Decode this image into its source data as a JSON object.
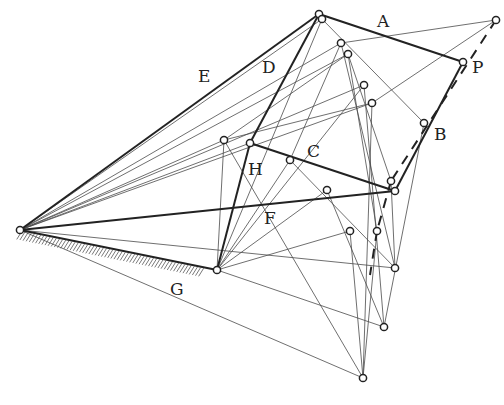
{
  "diagram": {
    "title": "",
    "labels": [
      {
        "id": "A",
        "text": "A",
        "x": 377,
        "y": 27
      },
      {
        "id": "P",
        "text": "P",
        "x": 472,
        "y": 73
      },
      {
        "id": "D",
        "text": "D",
        "x": 262,
        "y": 73
      },
      {
        "id": "E",
        "text": "E",
        "x": 198,
        "y": 82
      },
      {
        "id": "B",
        "text": "B",
        "x": 434,
        "y": 140
      },
      {
        "id": "C",
        "text": "C",
        "x": 307,
        "y": 157
      },
      {
        "id": "H",
        "text": "H",
        "x": 248,
        "y": 175
      },
      {
        "id": "F",
        "text": "F",
        "x": 264,
        "y": 224
      },
      {
        "id": "G",
        "text": "G",
        "x": 170,
        "y": 295
      }
    ],
    "nodes": [
      {
        "id": "O",
        "x": 20,
        "y": 230
      },
      {
        "id": "G2",
        "x": 217,
        "y": 270
      },
      {
        "id": "T",
        "x": 319,
        "y": 14
      },
      {
        "id": "T2",
        "x": 322,
        "y": 19
      },
      {
        "id": "P",
        "x": 463,
        "y": 62
      },
      {
        "id": "Q",
        "x": 496,
        "y": 20
      },
      {
        "id": "n1",
        "x": 341,
        "y": 43
      },
      {
        "id": "n2",
        "x": 348,
        "y": 54
      },
      {
        "id": "n3",
        "x": 364,
        "y": 85
      },
      {
        "id": "n4",
        "x": 372,
        "y": 103
      },
      {
        "id": "Bp",
        "x": 424,
        "y": 123
      },
      {
        "id": "Hp",
        "x": 250,
        "y": 143
      },
      {
        "id": "Lp",
        "x": 224,
        "y": 140
      },
      {
        "id": "Cp",
        "x": 290,
        "y": 160
      },
      {
        "id": "R1",
        "x": 391,
        "y": 181
      },
      {
        "id": "R2",
        "x": 395,
        "y": 191
      },
      {
        "id": "M",
        "x": 327,
        "y": 190
      },
      {
        "id": "S1",
        "x": 350,
        "y": 231
      },
      {
        "id": "S2",
        "x": 377,
        "y": 231
      },
      {
        "id": "V",
        "x": 395,
        "y": 268
      },
      {
        "id": "W",
        "x": 384,
        "y": 327
      },
      {
        "id": "X",
        "x": 363,
        "y": 378
      }
    ],
    "thick_links": [
      [
        "O",
        "T"
      ],
      [
        "T",
        "P"
      ],
      [
        "P",
        "R2"
      ],
      [
        "R2",
        "Hp"
      ],
      [
        "Hp",
        "T"
      ],
      [
        "Hp",
        "G2"
      ],
      [
        "O",
        "R2"
      ],
      [
        "O",
        "G2"
      ]
    ],
    "thin_links": [
      [
        "O",
        "T2"
      ],
      [
        "O",
        "n1"
      ],
      [
        "O",
        "n2"
      ],
      [
        "O",
        "n3"
      ],
      [
        "O",
        "n4"
      ],
      [
        "O",
        "Lp"
      ],
      [
        "O",
        "Hp"
      ],
      [
        "O",
        "V"
      ],
      [
        "O",
        "X"
      ],
      [
        "T2",
        "Bp"
      ],
      [
        "T2",
        "G2"
      ],
      [
        "n1",
        "Q"
      ],
      [
        "n1",
        "V"
      ],
      [
        "n2",
        "S2"
      ],
      [
        "n2",
        "R1"
      ],
      [
        "n3",
        "W"
      ],
      [
        "n3",
        "G2"
      ],
      [
        "n4",
        "X"
      ],
      [
        "n4",
        "Lp"
      ],
      [
        "Q",
        "n4"
      ],
      [
        "Lp",
        "n2"
      ],
      [
        "Bp",
        "W"
      ],
      [
        "Lp",
        "G2"
      ],
      [
        "Cp",
        "G2"
      ],
      [
        "Cp",
        "n1"
      ],
      [
        "Cp",
        "V"
      ],
      [
        "M",
        "G2"
      ],
      [
        "M",
        "W"
      ],
      [
        "S1",
        "G2"
      ],
      [
        "S1",
        "X"
      ],
      [
        "S2",
        "X"
      ],
      [
        "G2",
        "W"
      ],
      [
        "R1",
        "V"
      ],
      [
        "Lp",
        "X"
      ]
    ],
    "dashed_links": [
      [
        "Q",
        "R1"
      ],
      [
        "R1",
        "S2"
      ],
      [
        "S2",
        "X2"
      ]
    ],
    "dashed_end": {
      "x": 370,
      "y": 275
    },
    "ground": {
      "from": "O",
      "to": "G2",
      "label": "G"
    }
  }
}
